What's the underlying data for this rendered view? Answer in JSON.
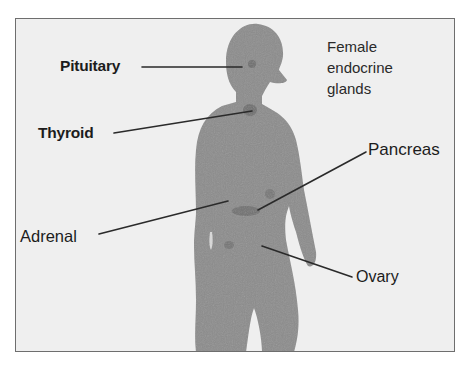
{
  "diagram": {
    "title_lines": [
      "Female",
      "endocrine",
      "glands"
    ],
    "colors": {
      "background": "#efefef",
      "frame_border": "#6e6e6e",
      "silhouette": "#8c8c8c",
      "gland_spot": "#6f6f6f",
      "leader_line": "#2a2a2a",
      "label_text": "#1c1c1c"
    },
    "labels": [
      {
        "id": "pituitary",
        "text": "Pituitary",
        "side": "left"
      },
      {
        "id": "thyroid",
        "text": "Thyroid",
        "side": "left"
      },
      {
        "id": "pancreas",
        "text": "Pancreas",
        "side": "right"
      },
      {
        "id": "adrenal",
        "text": "Adrenal",
        "side": "left"
      },
      {
        "id": "ovary",
        "text": "Ovary",
        "side": "right"
      }
    ]
  }
}
